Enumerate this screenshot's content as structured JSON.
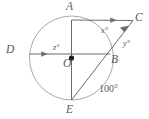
{
  "figure": {
    "kind": "circle-geometry-diagram",
    "colors": {
      "stroke": "#6b6b6b",
      "circle": "#a9a9a9",
      "label": "#585858",
      "background": "#ffffff",
      "dot": "#1a1a1a"
    },
    "circle": {
      "center_label": "O",
      "center": {
        "x": 71.5,
        "y": 58.0
      },
      "radius": 42.0
    },
    "points": [
      {
        "name": "A",
        "label": "A",
        "x": 71.5,
        "y": 20.0,
        "label_x": 66,
        "label_y": 1
      },
      {
        "name": "C",
        "label": "C",
        "x": 133.0,
        "y": 20.5,
        "label_x": 135,
        "label_y": 12
      },
      {
        "name": "B",
        "label": "B",
        "x": 110.0,
        "y": 54.0,
        "label_x": 111,
        "label_y": 54
      },
      {
        "name": "D",
        "label": "D",
        "x": 29.5,
        "y": 54.0,
        "label_x": 6,
        "label_y": 44
      },
      {
        "name": "E",
        "label": "E",
        "x": 71.5,
        "y": 100.0,
        "label_x": 66,
        "label_y": 104
      },
      {
        "name": "O",
        "label": "O",
        "x": 71.5,
        "y": 58.0,
        "label_x": 63,
        "label_y": 58
      }
    ],
    "angles": [
      {
        "name": "x",
        "label": "x°",
        "label_x": 101,
        "label_y": 27
      },
      {
        "name": "y",
        "label": "y°",
        "label_x": 123,
        "label_y": 40
      },
      {
        "name": "z",
        "label": "z°",
        "label_x": 53,
        "label_y": 44
      }
    ],
    "arcs": [
      {
        "name": "arc-BE",
        "label": "100°",
        "label_x": 99,
        "label_y": 84
      }
    ],
    "segments": [
      {
        "name": "segment-A-to-C",
        "from": "A",
        "to": "C",
        "arrow": true
      },
      {
        "name": "segment-D-to-B",
        "from": "D",
        "to": "B",
        "arrow": true
      },
      {
        "name": "segment-A-to-E",
        "from": "A",
        "to": "E",
        "arrow": false
      },
      {
        "name": "segment-E-to-C",
        "from": "E",
        "to": "C",
        "arrow": false
      }
    ]
  }
}
